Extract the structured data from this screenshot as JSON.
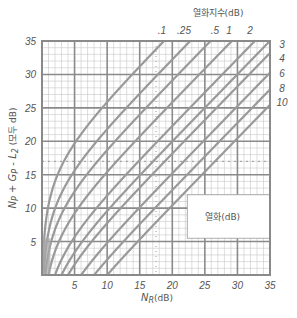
{
  "chart_data": {
    "type": "line",
    "title": "",
    "xlabel": "N_R(dB)",
    "ylabel": "N_P + G_P - L_2 (모두 dB)",
    "xlim": [
      0,
      35
    ],
    "ylim": [
      0,
      35
    ],
    "x_ticks": [
      "5",
      "10",
      "15",
      "20",
      "25",
      "30",
      "35"
    ],
    "y_ticks": [
      "5",
      "10",
      "15",
      "20",
      "25",
      "30",
      "35"
    ],
    "grid": true,
    "top_legend_title": "열화지수(dB)",
    "top_curve_labels": [
      ".1",
      ".25",
      ".5",
      "1",
      "2"
    ],
    "right_curve_labels": [
      "3",
      "4",
      "6",
      "8",
      "10"
    ],
    "box_label": "열화(dB)",
    "reference_lines": {
      "vertical_dotted_x": 17.5,
      "horizontal_dashed_y": 17
    },
    "series": [
      {
        "name": "0.1",
        "degradation_db": 0.1,
        "asymptote_offset": 16.3
      },
      {
        "name": "0.25",
        "degradation_db": 0.25,
        "asymptote_offset": 12.4
      },
      {
        "name": "0.5",
        "degradation_db": 0.5,
        "asymptote_offset": 9.1
      },
      {
        "name": "1",
        "degradation_db": 1,
        "asymptote_offset": 5.9
      },
      {
        "name": "2",
        "degradation_db": 2,
        "asymptote_offset": 2.3
      },
      {
        "name": "3",
        "degradation_db": 3,
        "asymptote_offset": 0.0
      },
      {
        "name": "4",
        "degradation_db": 4,
        "asymptote_offset": -2.2
      },
      {
        "name": "6",
        "degradation_db": 6,
        "asymptote_offset": -4.7
      },
      {
        "name": "8",
        "degradation_db": 8,
        "asymptote_offset": -7.3
      },
      {
        "name": "10",
        "degradation_db": 10,
        "asymptote_offset": -9.5
      }
    ]
  },
  "colors": {
    "grid_major": "#8a8a8a",
    "grid_minor": "#c8c8c8",
    "curve": "#999999",
    "text": "#555555"
  }
}
